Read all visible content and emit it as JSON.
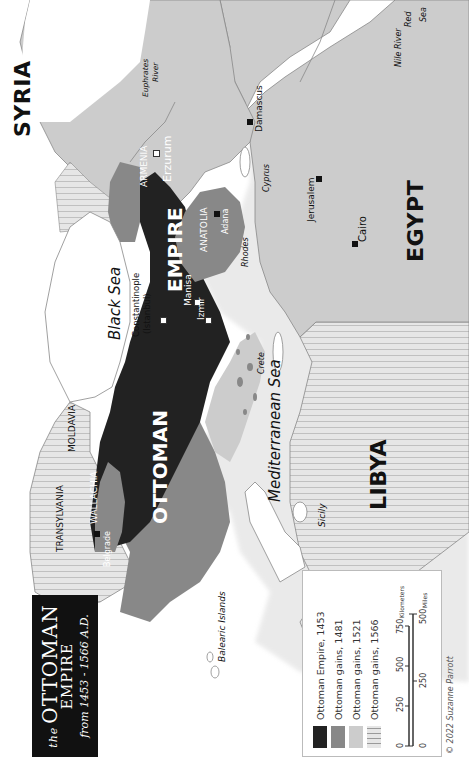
{
  "title": {
    "prefix": "the",
    "line1": "OTTOMAN",
    "line2": "EMPIRE",
    "subtitle": "from 1453 - 1566 A.D."
  },
  "legend": {
    "items": [
      {
        "label": "Ottoman Empire, 1453",
        "color": "#222222",
        "pattern": "solid"
      },
      {
        "label": "Ottoman gains, 1481",
        "color": "#888888",
        "pattern": "solid"
      },
      {
        "label": "Ottoman gains, 1521",
        "color": "#cccccc",
        "pattern": "solid"
      },
      {
        "label": "Ottoman gains, 1566",
        "color": "#e6e6e6",
        "pattern": "vertical-stripes"
      }
    ],
    "scale": {
      "km_ticks": [
        "0",
        "250",
        "500",
        "750"
      ],
      "km_unit": "Kilometers",
      "mi_ticks": [
        "0",
        "250",
        "500"
      ],
      "mi_unit": "Miles"
    },
    "credit": "© 2022 Suzanne Parrott"
  },
  "labels": {
    "countries": {
      "syria": "SYRIA",
      "egypt": "EGYPT",
      "libya": "LIBYA",
      "ottoman": "OTTOMAN",
      "empire": "EMPIRE"
    },
    "regions": {
      "transylvania": "TRANSYLVANIA",
      "moldavia": "MOLDAVIA",
      "wallachia": "WALLACHIA",
      "armenia": "ARMENIA",
      "anatolia": "ANATOLIA"
    },
    "seas": {
      "black_sea": "Black Sea",
      "mediterranean": "Mediterranean Sea",
      "red_sea_1": "Red",
      "red_sea_2": "Sea"
    },
    "rivers": {
      "euphrates_1": "Euphrates",
      "euphrates_2": "River",
      "nile": "Nile River"
    },
    "islands": {
      "balearic": "Balearic Islands",
      "sicily": "Sicily",
      "crete": "Crete",
      "rhodes": "Rhodes",
      "cyprus": "Cyprus"
    },
    "cities": {
      "belgrade": "Belgrade",
      "constantinople": "Constantinople",
      "istanbul": "(Istanbul)",
      "manisa": "Manisa",
      "izmir": "Izmir",
      "erzurum": "Erzurum",
      "adana": "Adana",
      "damascus": "Damascus",
      "jerusalem": "Jerusalem",
      "cairo": "Cairo"
    }
  },
  "colors": {
    "empire_1453": "#222222",
    "gains_1481": "#888888",
    "gains_1521": "#cccccc",
    "gains_1566_bg": "#e4e4e4",
    "stripe": "#9a9a9a",
    "water": "#ffffff",
    "land": "#ffffff",
    "coast": "#888888"
  }
}
